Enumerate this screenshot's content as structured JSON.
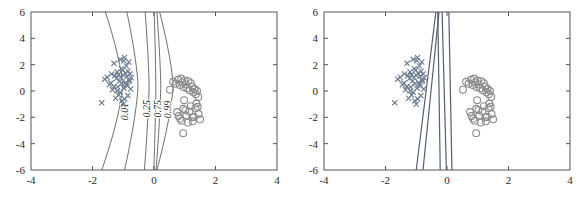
{
  "figure": {
    "title": "",
    "panel_count": 2,
    "background_color": "#ffffff",
    "axis_color": "#555555",
    "class_a_color": "#6b7a8f",
    "class_b_color": "#8a8a8a",
    "contour_color": "#5a5a5a",
    "boundary_color": "#55606e"
  },
  "chart_data": [
    {
      "type": "scatter",
      "panel": "left",
      "title": "",
      "subtitle": "",
      "xlabel": "",
      "ylabel": "",
      "xlim": [
        -4,
        4
      ],
      "ylim": [
        -6,
        6
      ],
      "xticks": [
        -4,
        -2,
        0,
        2,
        4
      ],
      "yticks": [
        -6,
        -4,
        -2,
        0,
        2,
        4,
        6
      ],
      "xticklabels": [
        "-4",
        "-2",
        "0",
        "2",
        "4"
      ],
      "yticklabels": [
        "-6",
        "-4",
        "-2",
        "0",
        "2",
        "4",
        "6"
      ],
      "grid": false,
      "legend": "none",
      "annotations": [
        "0.01",
        "0.25",
        "0.75",
        "0.99"
      ],
      "contour_levels": [
        0.01,
        0.25,
        0.5,
        0.75,
        0.99
      ],
      "contour_labels": [
        "0.01",
        "0.25",
        "0.75",
        "0.99"
      ],
      "series": [
        {
          "name": "class-x",
          "marker": "x",
          "color": "#6b7a8f",
          "x": [
            -1.7,
            -1.52,
            -1.45,
            -1.38,
            -1.3,
            -1.28,
            -1.22,
            -1.2,
            -1.18,
            -1.15,
            -1.12,
            -1.1,
            -1.08,
            -1.05,
            -1.02,
            -1.0,
            -0.98,
            -0.96,
            -0.94,
            -0.92,
            -0.9,
            -0.88,
            -0.86,
            -0.84,
            -0.82,
            -0.8,
            -0.78,
            -0.76,
            -0.74,
            -1.35,
            -1.25,
            -1.15,
            -1.05,
            -0.95,
            -0.85,
            -1.4,
            -1.1,
            -0.9,
            -1.0,
            -1.2,
            -0.8,
            -1.3,
            -1.6,
            -0.98,
            -1.06
          ],
          "y": [
            -0.9,
            1.05,
            0.5,
            1.3,
            2.1,
            1.15,
            0.95,
            1.45,
            0.3,
            1.25,
            0.75,
            2.4,
            1.05,
            0.55,
            1.6,
            1.2,
            0.2,
            2.55,
            1.35,
            0.65,
            1.9,
            1.1,
            0.4,
            1.5,
            2.2,
            0.85,
            1.3,
            0.15,
            1.0,
            0.1,
            -0.55,
            -0.3,
            -0.75,
            -0.6,
            -0.35,
            0.6,
            -0.1,
            0.5,
            -1.0,
            0.0,
            0.75,
            0.35,
            0.9,
            2.3,
            1.7
          ]
        },
        {
          "name": "class-o",
          "marker": "o",
          "color": "#8a8a8a",
          "x": [
            0.52,
            0.62,
            0.7,
            0.78,
            0.84,
            0.88,
            0.92,
            0.96,
            1.0,
            1.04,
            1.08,
            1.12,
            1.16,
            1.2,
            1.24,
            1.28,
            1.32,
            1.36,
            1.4,
            1.44,
            0.75,
            0.85,
            0.95,
            1.05,
            1.15,
            1.25,
            1.35,
            1.45,
            0.9,
            1.1,
            1.3,
            1.5,
            0.95,
            1.2,
            1.38,
            0.8,
            1.02,
            1.26,
            1.42,
            0.98
          ],
          "y": [
            0.1,
            0.7,
            0.55,
            0.85,
            0.45,
            0.95,
            0.65,
            0.3,
            0.8,
            0.5,
            0.2,
            0.75,
            0.05,
            0.6,
            0.35,
            -0.1,
            0.15,
            -0.25,
            0.0,
            -0.45,
            -1.6,
            -2.1,
            -1.35,
            -1.85,
            -1.55,
            -2.0,
            -1.3,
            -1.75,
            -2.25,
            -2.4,
            -1.95,
            -2.15,
            -3.2,
            -1.15,
            -0.95,
            -1.9,
            -1.45,
            -2.3,
            -1.2,
            -0.7
          ]
        }
      ]
    },
    {
      "type": "scatter",
      "panel": "right",
      "title": "",
      "subtitle": "",
      "xlabel": "",
      "ylabel": "",
      "xlim": [
        -4,
        4
      ],
      "ylim": [
        -6,
        6
      ],
      "xticks": [
        -4,
        -2,
        0,
        2,
        4
      ],
      "yticks": [
        -6,
        -4,
        -2,
        0,
        2,
        4,
        6
      ],
      "xticklabels": [
        "-4",
        "-2",
        "0",
        "2",
        "4"
      ],
      "yticklabels": [
        "-6",
        "-4",
        "-2",
        "0",
        "2",
        "4",
        "6"
      ],
      "grid": false,
      "legend": "none",
      "annotations": [],
      "boundary_lines": [
        {
          "name": "line-1",
          "top_x": -0.36,
          "bottom_x": -1.0
        },
        {
          "name": "line-2",
          "top_x": -0.26,
          "bottom_x": -0.78
        },
        {
          "name": "line-3",
          "top_x": -0.3,
          "bottom_x": -0.22
        },
        {
          "name": "line-4",
          "top_x": -0.16,
          "bottom_x": -0.02
        },
        {
          "name": "line-5",
          "top_x": 0.06,
          "bottom_x": 0.16
        }
      ],
      "series": [
        {
          "name": "class-x",
          "marker": "x",
          "color": "#6b7a8f",
          "x": [
            -1.7,
            -1.52,
            -1.45,
            -1.38,
            -1.3,
            -1.28,
            -1.22,
            -1.2,
            -1.18,
            -1.15,
            -1.12,
            -1.1,
            -1.08,
            -1.05,
            -1.02,
            -1.0,
            -0.98,
            -0.96,
            -0.94,
            -0.92,
            -0.9,
            -0.88,
            -0.86,
            -0.84,
            -0.82,
            -0.8,
            -0.78,
            -0.76,
            -0.74,
            -1.35,
            -1.25,
            -1.15,
            -1.05,
            -0.95,
            -0.85,
            -1.4,
            -1.1,
            -0.9,
            -1.0,
            -1.2,
            -0.8,
            -1.3,
            -1.6,
            -0.98,
            -1.06
          ],
          "y": [
            -0.9,
            1.05,
            0.5,
            1.3,
            2.1,
            1.15,
            0.95,
            1.45,
            0.3,
            1.25,
            0.75,
            2.4,
            1.05,
            0.55,
            1.6,
            1.2,
            0.2,
            2.55,
            1.35,
            0.65,
            1.9,
            1.1,
            0.4,
            1.5,
            2.2,
            0.85,
            1.3,
            0.15,
            1.0,
            0.1,
            -0.55,
            -0.3,
            -0.75,
            -0.6,
            -0.35,
            0.6,
            -0.1,
            0.5,
            -1.0,
            0.0,
            0.75,
            0.35,
            0.9,
            2.3,
            1.7
          ]
        },
        {
          "name": "class-o",
          "marker": "o",
          "color": "#8a8a8a",
          "x": [
            0.52,
            0.62,
            0.7,
            0.78,
            0.84,
            0.88,
            0.92,
            0.96,
            1.0,
            1.04,
            1.08,
            1.12,
            1.16,
            1.2,
            1.24,
            1.28,
            1.32,
            1.36,
            1.4,
            1.44,
            0.75,
            0.85,
            0.95,
            1.05,
            1.15,
            1.25,
            1.35,
            1.45,
            0.9,
            1.1,
            1.3,
            1.5,
            0.95,
            1.2,
            1.38,
            0.8,
            1.02,
            1.26,
            1.42,
            0.98
          ],
          "y": [
            0.1,
            0.7,
            0.55,
            0.85,
            0.45,
            0.95,
            0.65,
            0.3,
            0.8,
            0.5,
            0.2,
            0.75,
            0.05,
            0.6,
            0.35,
            -0.1,
            0.15,
            -0.25,
            0.0,
            -0.45,
            -1.6,
            -2.1,
            -1.35,
            -1.85,
            -1.55,
            -2.0,
            -1.3,
            -1.75,
            -2.25,
            -2.4,
            -1.95,
            -2.15,
            -3.2,
            -1.15,
            -0.95,
            -1.9,
            -1.45,
            -2.3,
            -1.2,
            -0.7
          ]
        }
      ]
    }
  ]
}
